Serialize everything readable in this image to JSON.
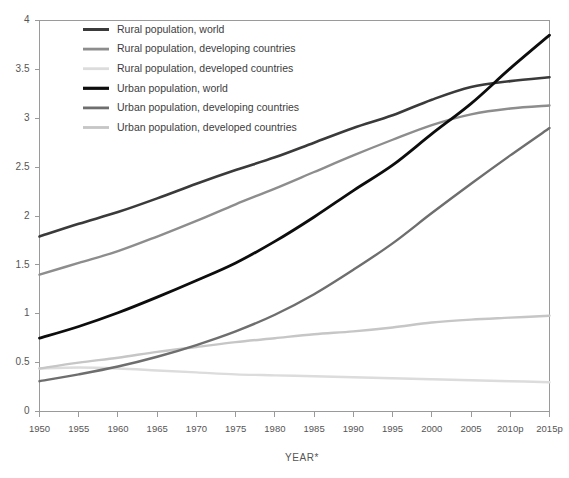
{
  "chart_data": {
    "type": "line",
    "title": "",
    "xlabel": "YEAR*",
    "ylabel": "",
    "grid": false,
    "legend_position": "top-left",
    "xlim": [
      1950,
      2015
    ],
    "ylim": [
      0,
      4
    ],
    "yticks": [
      "0",
      "0.5",
      "1",
      "1.5",
      "2",
      "2.5",
      "3",
      "3.5",
      "4"
    ],
    "ytick_values": [
      0,
      0.5,
      1,
      1.5,
      2,
      2.5,
      3,
      3.5,
      4
    ],
    "x": [
      1950,
      1955,
      1960,
      1965,
      1970,
      1975,
      1980,
      1985,
      1990,
      1995,
      2000,
      2005,
      2010,
      2015
    ],
    "xtick_labels": [
      "1950",
      "1955",
      "1960",
      "1965",
      "1970",
      "1975",
      "1980",
      "1985",
      "1990",
      "1995",
      "2000",
      "2005",
      "2010p",
      "2015p"
    ],
    "series": [
      {
        "name": "Rural population, world",
        "color": "#3a3a3a",
        "width": 2.6,
        "values": [
          1.79,
          1.92,
          2.04,
          2.18,
          2.33,
          2.47,
          2.6,
          2.75,
          2.9,
          3.03,
          3.19,
          3.32,
          3.38,
          3.42
        ]
      },
      {
        "name": "Rural population, developing countries",
        "color": "#8d8d8d",
        "width": 2.4,
        "values": [
          1.4,
          1.52,
          1.64,
          1.79,
          1.95,
          2.12,
          2.28,
          2.45,
          2.62,
          2.78,
          2.93,
          3.04,
          3.1,
          3.13
        ]
      },
      {
        "name": "Rural population, developed countries",
        "color": "#dcdcdc",
        "width": 2.4,
        "values": [
          0.44,
          0.45,
          0.44,
          0.42,
          0.4,
          0.38,
          0.37,
          0.36,
          0.35,
          0.34,
          0.33,
          0.32,
          0.31,
          0.3
        ]
      },
      {
        "name": "Urban population, world",
        "color": "#0d0d0d",
        "width": 2.8,
        "values": [
          0.75,
          0.87,
          1.01,
          1.17,
          1.34,
          1.52,
          1.74,
          1.99,
          2.26,
          2.52,
          2.84,
          3.15,
          3.51,
          3.85
        ]
      },
      {
        "name": "Urban population, developing countries",
        "color": "#6e6e6e",
        "width": 2.4,
        "values": [
          0.31,
          0.38,
          0.46,
          0.56,
          0.68,
          0.82,
          0.99,
          1.2,
          1.45,
          1.72,
          2.03,
          2.33,
          2.62,
          2.9
        ]
      },
      {
        "name": "Urban population, developed countries",
        "color": "#c6c6c6",
        "width": 2.4,
        "values": [
          0.44,
          0.5,
          0.55,
          0.61,
          0.66,
          0.71,
          0.75,
          0.79,
          0.82,
          0.86,
          0.91,
          0.94,
          0.96,
          0.98
        ]
      }
    ]
  },
  "legend": {
    "items": [
      {
        "label": "Rural population, world"
      },
      {
        "label": "Rural population, developing countries"
      },
      {
        "label": "Rural population, developed countries"
      },
      {
        "label": "Urban population, world"
      },
      {
        "label": "Urban population, developing countries"
      },
      {
        "label": "Urban population, developed countries"
      }
    ]
  },
  "axes": {
    "x_title": "YEAR*"
  }
}
